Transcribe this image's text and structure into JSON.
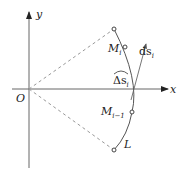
{
  "diagram": {
    "axes": {
      "x_label": "x",
      "y_label": "y",
      "origin_label": "O"
    },
    "points": [
      {
        "id": "top",
        "label": ""
      },
      {
        "id": "M_i",
        "label": "M",
        "sub": "i"
      },
      {
        "id": "M_i_minus_1",
        "label": "M",
        "sub": "i−1"
      },
      {
        "id": "L",
        "label": "L"
      }
    ],
    "arc_label": {
      "main": "Δs",
      "sub": "i"
    },
    "tangent_label": {
      "main": "ds",
      "sub": "i"
    },
    "colors": {
      "stroke": "#555555",
      "dashed": "#999999"
    }
  }
}
